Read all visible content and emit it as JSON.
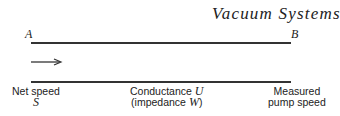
{
  "header": {
    "title": "Vacuum Systems"
  },
  "diagram": {
    "point_a": "A",
    "point_b": "B",
    "flow_direction": "right-arrow-icon",
    "labels": {
      "net_speed": {
        "line1": "Net speed",
        "symbol": "S"
      },
      "conductance": {
        "line1_text": "Conductance ",
        "line1_symbol": "U",
        "line2_text": "(impedance ",
        "line2_symbol": "W",
        "line2_close": ")"
      },
      "measured": {
        "line1": "Measured",
        "line2": "pump speed"
      }
    }
  }
}
